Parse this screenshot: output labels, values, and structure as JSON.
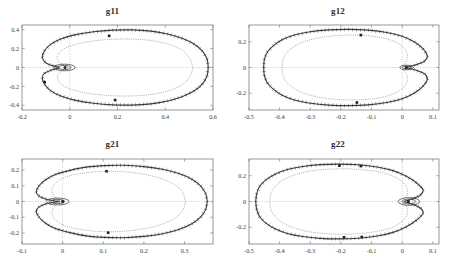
{
  "figure": {
    "background_color": "#ffffff",
    "panel_count": 4
  },
  "chart_data": [
    {
      "type": "line",
      "title": "g11",
      "xlabel": "",
      "ylabel": "",
      "xlim": [
        -0.2,
        0.6
      ],
      "ylim": [
        -0.45,
        0.45
      ],
      "xticks": [
        -0.2,
        0,
        0.2,
        0.4,
        0.6
      ],
      "xticklabels": [
        "-0.2",
        "0",
        "0.2",
        "0.4",
        "0.6"
      ],
      "yticks": [
        -0.4,
        -0.2,
        0,
        0.2,
        0.4
      ],
      "yticklabels": [
        "-0.4",
        "-0.2",
        "0",
        "0.2",
        "0.4"
      ],
      "grid": true,
      "legend": null,
      "series": [
        {
          "name": "outer-value-set-boundary",
          "style": "solid-with-hatch-ticks",
          "closed": true,
          "x": [
            0.58,
            0.575,
            0.555,
            0.52,
            0.47,
            0.41,
            0.34,
            0.26,
            0.18,
            0.1,
            0.02,
            -0.04,
            -0.08,
            -0.105,
            -0.115,
            -0.105,
            -0.085,
            -0.06,
            -0.045,
            -0.055,
            -0.08,
            -0.105,
            -0.115,
            -0.105,
            -0.08,
            -0.04,
            0.02,
            0.1,
            0.18,
            0.26,
            0.34,
            0.41,
            0.47,
            0.52,
            0.555,
            0.575,
            0.58
          ],
          "y": [
            0.0,
            0.09,
            0.175,
            0.25,
            0.31,
            0.355,
            0.385,
            0.398,
            0.395,
            0.378,
            0.345,
            0.3,
            0.245,
            0.18,
            0.11,
            0.06,
            0.03,
            0.012,
            0.0,
            -0.012,
            -0.03,
            -0.06,
            -0.11,
            -0.18,
            -0.245,
            -0.3,
            -0.345,
            -0.378,
            -0.395,
            -0.398,
            -0.385,
            -0.355,
            -0.31,
            -0.25,
            -0.175,
            -0.09,
            0.0
          ]
        },
        {
          "name": "inner-value-set-boundary",
          "style": "dotted",
          "closed": true,
          "x": [
            0.515,
            0.508,
            0.49,
            0.46,
            0.415,
            0.36,
            0.3,
            0.23,
            0.16,
            0.09,
            0.03,
            -0.015,
            -0.04,
            -0.052,
            -0.05,
            -0.04,
            -0.025,
            -0.012,
            -0.005,
            -0.012,
            -0.025,
            -0.04,
            -0.05,
            -0.052,
            -0.04,
            -0.015,
            0.03,
            0.09,
            0.16,
            0.23,
            0.3,
            0.36,
            0.415,
            0.46,
            0.49,
            0.508,
            0.515
          ],
          "y": [
            0.0,
            0.07,
            0.14,
            0.198,
            0.245,
            0.278,
            0.296,
            0.302,
            0.296,
            0.278,
            0.248,
            0.21,
            0.165,
            0.12,
            0.08,
            0.05,
            0.028,
            0.012,
            0.0,
            -0.012,
            -0.028,
            -0.05,
            -0.08,
            -0.12,
            -0.165,
            -0.21,
            -0.248,
            -0.278,
            -0.296,
            -0.302,
            -0.296,
            -0.278,
            -0.245,
            -0.198,
            -0.14,
            -0.07,
            0.0
          ]
        },
        {
          "name": "origin-loop",
          "style": "solid-small-closed-loop",
          "closed": true,
          "center": [
            -0.022,
            0.0
          ],
          "rx": 0.045,
          "ry": 0.035
        }
      ],
      "markers": [
        {
          "x": 0.165,
          "y": 0.335
        },
        {
          "x": 0.19,
          "y": -0.345
        },
        {
          "x": -0.105,
          "y": -0.155
        },
        {
          "x": -0.02,
          "y": 0.0
        }
      ]
    },
    {
      "type": "line",
      "title": "g12",
      "xlabel": "",
      "ylabel": "",
      "xlim": [
        -0.5,
        0.12
      ],
      "ylim": [
        -0.33,
        0.33
      ],
      "xticks": [
        -0.5,
        -0.4,
        -0.3,
        -0.2,
        -0.1,
        0,
        0.1
      ],
      "xticklabels": [
        "-0.5",
        "-0.4",
        "-0.3",
        "-0.2",
        "-0.1",
        "0",
        "0.1"
      ],
      "yticks": [
        -0.2,
        0,
        0.2
      ],
      "yticklabels": [
        "-0.2",
        "0",
        "0.2"
      ],
      "grid": true,
      "legend": null,
      "series": [
        {
          "name": "outer-value-set-boundary",
          "style": "solid-with-hatch-ticks",
          "closed": true,
          "x": [
            -0.452,
            -0.45,
            -0.44,
            -0.42,
            -0.392,
            -0.352,
            -0.3,
            -0.24,
            -0.175,
            -0.11,
            -0.05,
            0.0,
            0.04,
            0.068,
            0.082,
            0.072,
            0.05,
            0.028,
            0.014,
            0.028,
            0.05,
            0.072,
            0.082,
            0.068,
            0.04,
            0.0,
            -0.05,
            -0.11,
            -0.175,
            -0.24,
            -0.3,
            -0.352,
            -0.392,
            -0.42,
            -0.44,
            -0.45,
            -0.452
          ],
          "y": [
            0.0,
            0.062,
            0.12,
            0.17,
            0.215,
            0.252,
            0.278,
            0.292,
            0.296,
            0.29,
            0.272,
            0.242,
            0.198,
            0.145,
            0.088,
            0.048,
            0.025,
            0.01,
            0.0,
            -0.01,
            -0.025,
            -0.048,
            -0.088,
            -0.145,
            -0.198,
            -0.242,
            -0.272,
            -0.29,
            -0.296,
            -0.292,
            -0.278,
            -0.252,
            -0.215,
            -0.17,
            -0.12,
            -0.062,
            0.0
          ]
        },
        {
          "name": "inner-value-set-boundary",
          "style": "dotted",
          "closed": true,
          "x": [
            -0.392,
            -0.39,
            -0.382,
            -0.365,
            -0.34,
            -0.305,
            -0.262,
            -0.212,
            -0.16,
            -0.108,
            -0.06,
            -0.022,
            0.004,
            0.016,
            0.016,
            0.01,
            0.004,
            0.0,
            -0.002,
            0.0,
            0.004,
            0.01,
            0.016,
            0.016,
            0.004,
            -0.022,
            -0.06,
            -0.108,
            -0.16,
            -0.212,
            -0.262,
            -0.305,
            -0.34,
            -0.365,
            -0.382,
            -0.39,
            -0.392
          ],
          "y": [
            0.0,
            0.05,
            0.098,
            0.142,
            0.18,
            0.212,
            0.235,
            0.248,
            0.252,
            0.246,
            0.228,
            0.198,
            0.155,
            0.108,
            0.065,
            0.036,
            0.018,
            0.006,
            0.0,
            -0.006,
            -0.018,
            -0.036,
            -0.065,
            -0.108,
            -0.155,
            -0.198,
            -0.228,
            -0.246,
            -0.252,
            -0.248,
            -0.235,
            -0.212,
            -0.18,
            -0.142,
            -0.098,
            -0.05,
            0.0
          ]
        },
        {
          "name": "origin-loop",
          "style": "solid-small-closed-loop",
          "closed": true,
          "center": [
            0.014,
            0.0
          ],
          "rx": 0.022,
          "ry": 0.018
        }
      ],
      "markers": [
        {
          "x": -0.135,
          "y": 0.252
        },
        {
          "x": -0.148,
          "y": -0.272
        },
        {
          "x": 0.013,
          "y": 0.0
        }
      ]
    },
    {
      "type": "line",
      "title": "g21",
      "xlabel": "",
      "ylabel": "",
      "xlim": [
        -0.1,
        0.37
      ],
      "ylim": [
        -0.27,
        0.27
      ],
      "xticks": [
        -0.1,
        0,
        0.1,
        0.2,
        0.3
      ],
      "xticklabels": [
        "-0.1",
        "0",
        "0.1",
        "0.2",
        "0.3"
      ],
      "yticks": [
        -0.2,
        -0.1,
        0,
        0.1,
        0.2
      ],
      "yticklabels": [
        "-0.2",
        "-0.1",
        "0",
        "0.1",
        "0.2"
      ],
      "grid": true,
      "legend": null,
      "series": [
        {
          "name": "outer-value-set-boundary",
          "style": "solid-with-hatch-ticks",
          "closed": true,
          "x": [
            0.356,
            0.352,
            0.34,
            0.318,
            0.286,
            0.246,
            0.2,
            0.152,
            0.104,
            0.058,
            0.018,
            -0.018,
            -0.042,
            -0.058,
            -0.065,
            -0.058,
            -0.042,
            -0.022,
            -0.008,
            -0.022,
            -0.042,
            -0.058,
            -0.065,
            -0.058,
            -0.042,
            -0.018,
            0.018,
            0.058,
            0.104,
            0.152,
            0.2,
            0.246,
            0.286,
            0.318,
            0.34,
            0.352,
            0.356
          ],
          "y": [
            0.0,
            0.05,
            0.098,
            0.142,
            0.178,
            0.205,
            0.222,
            0.23,
            0.228,
            0.218,
            0.198,
            0.172,
            0.138,
            0.1,
            0.062,
            0.034,
            0.016,
            0.005,
            0.0,
            -0.005,
            -0.016,
            -0.034,
            -0.062,
            -0.1,
            -0.138,
            -0.172,
            -0.198,
            -0.218,
            -0.228,
            -0.23,
            -0.222,
            -0.205,
            -0.178,
            -0.142,
            -0.098,
            -0.05,
            0.0
          ]
        },
        {
          "name": "inner-value-set-boundary",
          "style": "dotted",
          "closed": true,
          "x": [
            0.302,
            0.298,
            0.288,
            0.268,
            0.24,
            0.206,
            0.168,
            0.128,
            0.088,
            0.05,
            0.018,
            -0.006,
            -0.02,
            -0.026,
            -0.024,
            -0.018,
            -0.01,
            -0.004,
            0.0,
            -0.004,
            -0.01,
            -0.018,
            -0.024,
            -0.026,
            -0.02,
            -0.006,
            0.018,
            0.05,
            0.088,
            0.128,
            0.168,
            0.206,
            0.24,
            0.268,
            0.288,
            0.298,
            0.302
          ],
          "y": [
            0.0,
            0.042,
            0.082,
            0.118,
            0.148,
            0.17,
            0.185,
            0.192,
            0.19,
            0.18,
            0.164,
            0.14,
            0.11,
            0.078,
            0.048,
            0.026,
            0.012,
            0.004,
            0.0,
            -0.004,
            -0.012,
            -0.026,
            -0.048,
            -0.078,
            -0.11,
            -0.14,
            -0.164,
            -0.18,
            -0.19,
            -0.192,
            -0.185,
            -0.17,
            -0.148,
            -0.118,
            -0.082,
            -0.042,
            0.0
          ]
        },
        {
          "name": "origin-loop",
          "style": "solid-small-closed-loop",
          "closed": true,
          "center": [
            -0.012,
            0.0
          ],
          "rx": 0.028,
          "ry": 0.022
        }
      ],
      "markers": [
        {
          "x": 0.108,
          "y": 0.192
        },
        {
          "x": 0.112,
          "y": -0.198
        },
        {
          "x": 0.0,
          "y": 0.0
        }
      ]
    },
    {
      "type": "line",
      "title": "g22",
      "xlabel": "",
      "ylabel": "",
      "xlim": [
        -0.5,
        0.12
      ],
      "ylim": [
        -0.33,
        0.33
      ],
      "xticks": [
        -0.5,
        -0.4,
        -0.3,
        -0.2,
        -0.1,
        0,
        0.1
      ],
      "xticklabels": [
        "-0.5",
        "-0.4",
        "-0.3",
        "-0.2",
        "-0.1",
        "0",
        "0.1"
      ],
      "yticks": [
        -0.2,
        0,
        0.2
      ],
      "yticklabels": [
        "-0.2",
        "0",
        "0.2"
      ],
      "grid": true,
      "legend": null,
      "series": [
        {
          "name": "outer-value-set-boundary",
          "style": "solid-with-hatch-ticks",
          "closed": true,
          "x": [
            -0.478,
            -0.475,
            -0.465,
            -0.445,
            -0.415,
            -0.375,
            -0.325,
            -0.268,
            -0.205,
            -0.142,
            -0.082,
            -0.03,
            0.012,
            0.045,
            0.068,
            0.06,
            0.042,
            0.022,
            0.008,
            0.022,
            0.042,
            0.06,
            0.068,
            0.045,
            0.012,
            -0.03,
            -0.082,
            -0.142,
            -0.205,
            -0.268,
            -0.325,
            -0.375,
            -0.415,
            -0.445,
            -0.465,
            -0.475,
            -0.478
          ],
          "y": [
            0.0,
            0.06,
            0.118,
            0.168,
            0.212,
            0.248,
            0.272,
            0.286,
            0.29,
            0.285,
            0.268,
            0.24,
            0.198,
            0.148,
            0.092,
            0.052,
            0.028,
            0.012,
            0.0,
            -0.012,
            -0.028,
            -0.052,
            -0.092,
            -0.148,
            -0.198,
            -0.24,
            -0.268,
            -0.285,
            -0.29,
            -0.286,
            -0.272,
            -0.248,
            -0.212,
            -0.168,
            -0.118,
            -0.06,
            0.0
          ]
        },
        {
          "name": "inner-value-set-boundary",
          "style": "dotted",
          "closed": true,
          "x": [
            -0.432,
            -0.43,
            -0.42,
            -0.402,
            -0.375,
            -0.34,
            -0.296,
            -0.245,
            -0.19,
            -0.135,
            -0.082,
            -0.038,
            -0.006,
            0.012,
            0.018,
            0.014,
            0.006,
            0.0,
            -0.004,
            0.0,
            0.006,
            0.014,
            0.018,
            0.012,
            -0.006,
            -0.038,
            -0.082,
            -0.135,
            -0.19,
            -0.245,
            -0.296,
            -0.34,
            -0.375,
            -0.402,
            -0.42,
            -0.43,
            -0.432
          ],
          "y": [
            0.0,
            0.052,
            0.102,
            0.146,
            0.184,
            0.215,
            0.238,
            0.25,
            0.254,
            0.248,
            0.232,
            0.205,
            0.165,
            0.118,
            0.072,
            0.04,
            0.02,
            0.008,
            0.0,
            -0.008,
            -0.02,
            -0.04,
            -0.072,
            -0.118,
            -0.165,
            -0.205,
            -0.232,
            -0.248,
            -0.254,
            -0.25,
            -0.238,
            -0.215,
            -0.184,
            -0.146,
            -0.102,
            -0.052,
            0.0
          ]
        },
        {
          "name": "origin-loop",
          "style": "solid-small-closed-loop",
          "closed": true,
          "center": [
            0.022,
            0.0
          ],
          "rx": 0.035,
          "ry": 0.03
        }
      ],
      "markers": [
        {
          "x": -0.205,
          "y": 0.278
        },
        {
          "x": -0.135,
          "y": 0.275
        },
        {
          "x": -0.19,
          "y": -0.278
        },
        {
          "x": -0.132,
          "y": -0.275
        },
        {
          "x": 0.02,
          "y": 0.0
        }
      ]
    }
  ]
}
